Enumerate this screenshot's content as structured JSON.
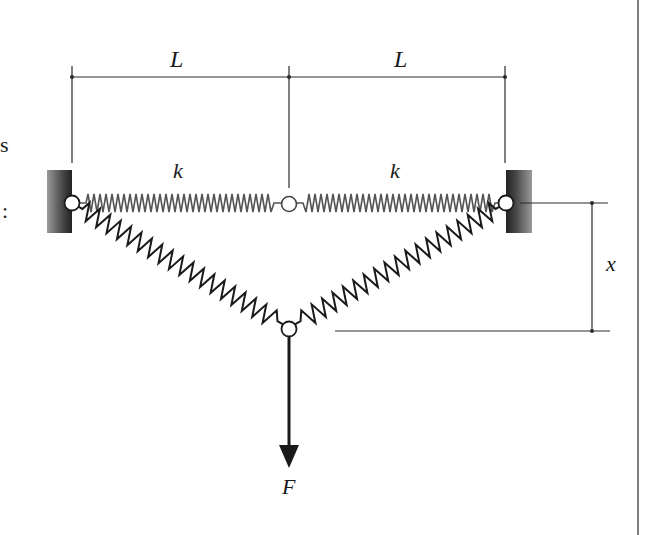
{
  "figure": {
    "labels": {
      "length_left": "L",
      "length_right": "L",
      "stiffness_left": "k",
      "stiffness_right": "k",
      "deflection": "x",
      "force": "F"
    },
    "left_edge_fragments": [
      "s",
      ":"
    ],
    "colors": {
      "line": "#2a2a2a",
      "spring_upper": "#555555",
      "spring_lower": "#1a1a1a",
      "wall_dark": "#2b2b2b",
      "wall_light": "#8a8a8a",
      "border": "#555555",
      "background": "#ffffff"
    },
    "components": {
      "walls": 2,
      "pins": 4,
      "springs_visible": 4,
      "arrow_direction": "down"
    }
  }
}
